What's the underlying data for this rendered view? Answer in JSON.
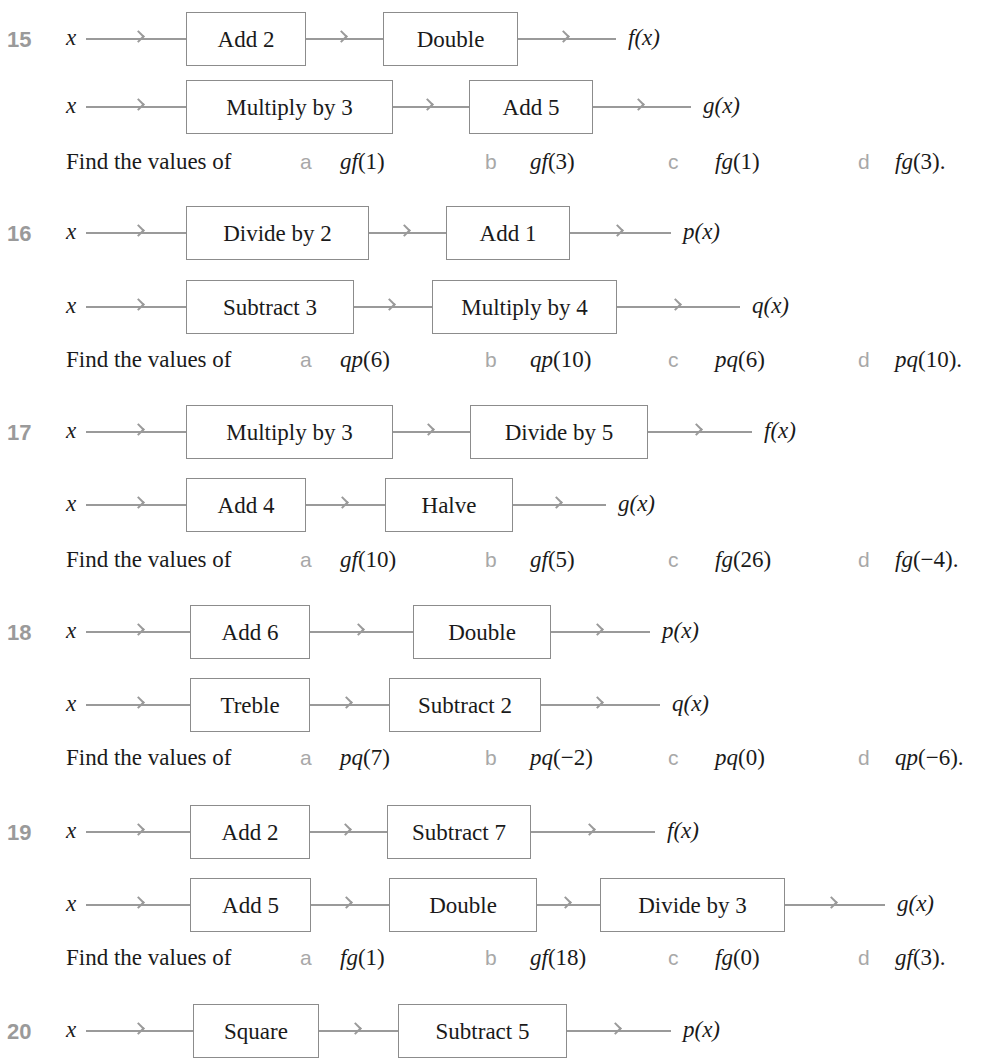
{
  "header_cut_text": "Book operations",
  "input_var": "x",
  "find_label": "Find the values of",
  "colors": {
    "number": "#9a9a9a",
    "arrow": "#9a9a9a",
    "box_border": "#8c8c8c",
    "letter": "#a8a8a8",
    "text": "#1a1a1a"
  },
  "problems": [
    {
      "number": "15",
      "machines": [
        {
          "boxes": [
            "Add 2",
            "Double"
          ],
          "output": "f(x)"
        },
        {
          "boxes": [
            "Multiply by 3",
            "Add 5"
          ],
          "output": "g(x)"
        }
      ],
      "parts": [
        {
          "letter": "a",
          "fn": "gf",
          "arg": "(1)"
        },
        {
          "letter": "b",
          "fn": "gf",
          "arg": "(3)"
        },
        {
          "letter": "c",
          "fn": "fg",
          "arg": "(1)"
        },
        {
          "letter": "d",
          "fn": "fg",
          "arg": "(3)."
        }
      ]
    },
    {
      "number": "16",
      "machines": [
        {
          "boxes": [
            "Divide by 2",
            "Add 1"
          ],
          "output": "p(x)"
        },
        {
          "boxes": [
            "Subtract 3",
            "Multiply by 4"
          ],
          "output": "q(x)"
        }
      ],
      "parts": [
        {
          "letter": "a",
          "fn": "qp",
          "arg": "(6)"
        },
        {
          "letter": "b",
          "fn": "qp",
          "arg": "(10)"
        },
        {
          "letter": "c",
          "fn": "pq",
          "arg": "(6)"
        },
        {
          "letter": "d",
          "fn": "pq",
          "arg": "(10)."
        }
      ]
    },
    {
      "number": "17",
      "machines": [
        {
          "boxes": [
            "Multiply by 3",
            "Divide by 5"
          ],
          "output": "f(x)"
        },
        {
          "boxes": [
            "Add 4",
            "Halve"
          ],
          "output": "g(x)"
        }
      ],
      "parts": [
        {
          "letter": "a",
          "fn": "gf",
          "arg": "(10)"
        },
        {
          "letter": "b",
          "fn": "gf",
          "arg": "(5)"
        },
        {
          "letter": "c",
          "fn": "fg",
          "arg": "(26)"
        },
        {
          "letter": "d",
          "fn": "fg",
          "arg": "(−4)."
        }
      ]
    },
    {
      "number": "18",
      "machines": [
        {
          "boxes": [
            "Add 6",
            "Double"
          ],
          "output": "p(x)"
        },
        {
          "boxes": [
            "Treble",
            "Subtract 2"
          ],
          "output": "q(x)"
        }
      ],
      "parts": [
        {
          "letter": "a",
          "fn": "pq",
          "arg": "(7)"
        },
        {
          "letter": "b",
          "fn": "pq",
          "arg": "(−2)"
        },
        {
          "letter": "c",
          "fn": "pq",
          "arg": "(0)"
        },
        {
          "letter": "d",
          "fn": "qp",
          "arg": "(−6)."
        }
      ]
    },
    {
      "number": "19",
      "machines": [
        {
          "boxes": [
            "Add 2",
            "Subtract 7"
          ],
          "output": "f(x)"
        },
        {
          "boxes": [
            "Add 5",
            "Double",
            "Divide by 3"
          ],
          "output": "g(x)"
        }
      ],
      "parts": [
        {
          "letter": "a",
          "fn": "fg",
          "arg": "(1)"
        },
        {
          "letter": "b",
          "fn": "gf",
          "arg": "(18)"
        },
        {
          "letter": "c",
          "fn": "fg",
          "arg": "(0)"
        },
        {
          "letter": "d",
          "fn": "gf",
          "arg": "(3)."
        }
      ]
    },
    {
      "number": "20",
      "machines": [
        {
          "boxes": [
            "Square",
            "Subtract 5"
          ],
          "output": "p(x)"
        }
      ],
      "parts": []
    }
  ]
}
